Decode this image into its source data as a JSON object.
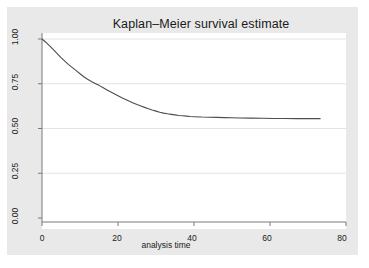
{
  "chart_data": {
    "type": "line",
    "title": "Kaplan–Meier survival estimate",
    "subtitle": "",
    "xlabel": "analysis time",
    "ylabel": "",
    "xlim": [
      0,
      80
    ],
    "ylim": [
      0,
      1.0
    ],
    "xticks": [
      0,
      20,
      40,
      60,
      80
    ],
    "xtick_labels": [
      "0",
      "20",
      "40",
      "60",
      "80"
    ],
    "yticks": [
      0.0,
      0.25,
      0.5,
      0.75,
      1.0
    ],
    "ytick_labels": [
      "0.00",
      "0.25",
      "0.50",
      "0.75",
      "1.00"
    ],
    "grid": "horizontal",
    "legend": "none",
    "line_color": "#4d4d4d",
    "plot_background": "#ffffff",
    "figure_background": "#e9e9e9",
    "series": [
      {
        "name": "Survivor function",
        "x": [
          0,
          1,
          2,
          3,
          4,
          5,
          6,
          7,
          8,
          9,
          10,
          11,
          12,
          13,
          14,
          15,
          16,
          17,
          18,
          19,
          20,
          21,
          22,
          23,
          24,
          25,
          26,
          27,
          28,
          29,
          30,
          31,
          32,
          33,
          34,
          35,
          36,
          37,
          38,
          39,
          40,
          42,
          44,
          46,
          48,
          50,
          52,
          55,
          58,
          61,
          64,
          67,
          70,
          73.3
        ],
        "y": [
          1.0,
          0.982,
          0.962,
          0.94,
          0.918,
          0.896,
          0.876,
          0.857,
          0.84,
          0.823,
          0.806,
          0.789,
          0.775,
          0.763,
          0.752,
          0.741,
          0.729,
          0.717,
          0.705,
          0.694,
          0.683,
          0.672,
          0.662,
          0.652,
          0.643,
          0.634,
          0.626,
          0.618,
          0.61,
          0.603,
          0.597,
          0.591,
          0.586,
          0.582,
          0.579,
          0.576,
          0.573,
          0.571,
          0.569,
          0.567,
          0.566,
          0.564,
          0.563,
          0.562,
          0.561,
          0.56,
          0.559,
          0.558,
          0.557,
          0.556,
          0.556,
          0.555,
          0.555,
          0.555
        ]
      }
    ]
  },
  "axis": {
    "x_tick_labels": [
      "0",
      "20",
      "40",
      "60",
      "80"
    ],
    "y_tick_labels": [
      "0.00",
      "0.25",
      "0.50",
      "0.75",
      "1.00"
    ]
  }
}
